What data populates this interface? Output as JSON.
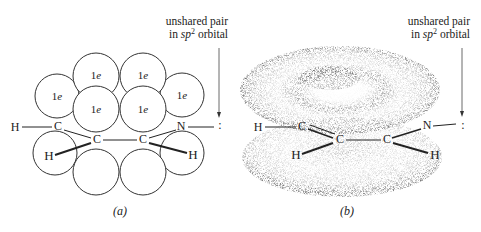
{
  "panel_a": {
    "note_line1": "unshared pair",
    "note_line2_prefix": "in ",
    "note_line2_italic": "sp",
    "note_line2_sup": "2",
    "note_line2_suffix": " orbital",
    "caption": "(a)",
    "electron_label": "1e",
    "atoms": {
      "h_left": "H",
      "c1": "C",
      "c2": "C",
      "c3": "C",
      "n": "N",
      "h_bottom_left": "H",
      "h_bottom_right": "H",
      "lone_pair": ":"
    }
  },
  "panel_b": {
    "note_line1": "unshared pair",
    "note_line2_prefix": "in ",
    "note_line2_italic": "sp",
    "note_line2_sup": "2",
    "note_line2_suffix": " orbital",
    "caption": "(b)",
    "atoms": {
      "h_left": "H",
      "c1": "C",
      "c2": "C",
      "c3": "C",
      "n": "N",
      "h_bottom_left": "H",
      "h_bottom_right": "H",
      "lone_pair": ":"
    }
  }
}
